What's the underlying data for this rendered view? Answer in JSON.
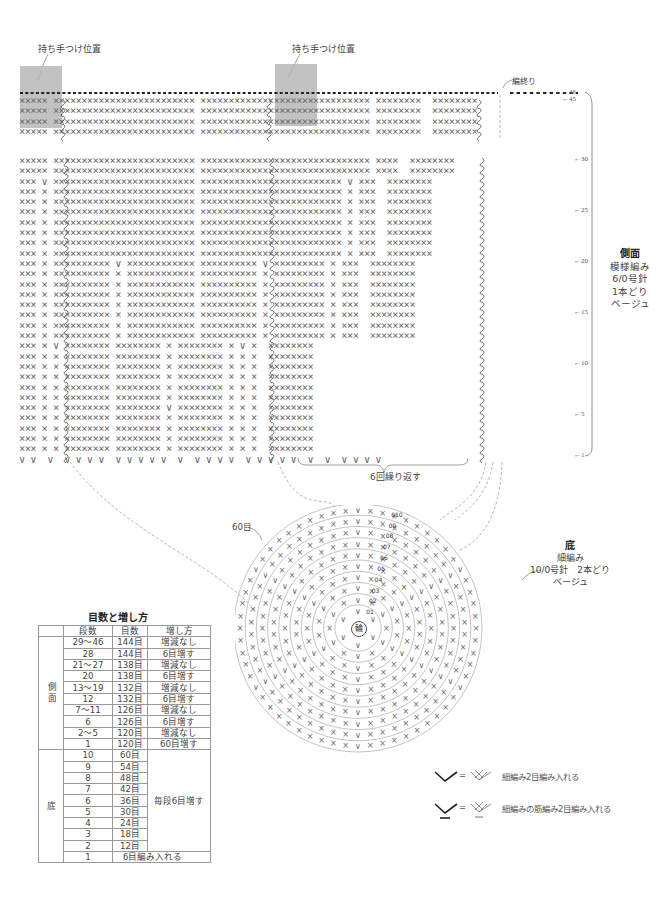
{
  "labels": {
    "handle_position_1": "持ち手つけ位置",
    "handle_position_2": "持ち手つけ位置",
    "finish": "編終り",
    "repeat": "6回繰り返す",
    "bottom_60": "60目",
    "center_ring": "輪"
  },
  "side_info": {
    "title": "側面",
    "pattern": "模様編み",
    "hook": "6/0号針",
    "strands": "1本どり",
    "color": "ベージュ"
  },
  "bottom_info": {
    "title": "底",
    "pattern": "細編み",
    "hook": "10/0号針　2本どり",
    "color": "ベージュ"
  },
  "row_markers": [
    "←46",
    "←45",
    "←30",
    "←25",
    "←20",
    "←15",
    "←10",
    "←5",
    "←1"
  ],
  "round_markers": [
    "1",
    "2",
    "3",
    "4",
    "5",
    "6",
    "7",
    "8",
    "9",
    "10"
  ],
  "table": {
    "title": "目数と増し方",
    "headers": [
      "段数",
      "目数",
      "増し方"
    ],
    "side_group": "側面",
    "bottom_group": "底",
    "side_rows": [
      {
        "rows": "29～46",
        "count": "144目",
        "method": "増減なし"
      },
      {
        "rows": "28",
        "count": "144目",
        "method": "6目増す"
      },
      {
        "rows": "21～27",
        "count": "138目",
        "method": "増減なし"
      },
      {
        "rows": "20",
        "count": "138目",
        "method": "6目増す"
      },
      {
        "rows": "13～19",
        "count": "132目",
        "method": "増減なし"
      },
      {
        "rows": "12",
        "count": "132目",
        "method": "6目増す"
      },
      {
        "rows": "7～11",
        "count": "126目",
        "method": "増減なし"
      },
      {
        "rows": "6",
        "count": "126目",
        "method": "6目増す"
      },
      {
        "rows": "2～5",
        "count": "120目",
        "method": "増減なし"
      },
      {
        "rows": "1",
        "count": "120目",
        "method": "60目増す"
      }
    ],
    "bottom_rows": [
      {
        "rows": "10",
        "count": "60目"
      },
      {
        "rows": "9",
        "count": "54目"
      },
      {
        "rows": "8",
        "count": "48目"
      },
      {
        "rows": "7",
        "count": "42目"
      },
      {
        "rows": "6",
        "count": "36目"
      },
      {
        "rows": "5",
        "count": "30目"
      },
      {
        "rows": "4",
        "count": "24目"
      },
      {
        "rows": "3",
        "count": "18目"
      },
      {
        "rows": "2",
        "count": "12目"
      }
    ],
    "bottom_method": "毎段6目増す",
    "bottom_first": {
      "rows": "1",
      "text": "6目編み入れる"
    }
  },
  "legend": [
    {
      "symbol": "v-increase-icon",
      "eq": "=",
      "text": "細編み2目編み入れる"
    },
    {
      "symbol": "v-underline-increase-icon",
      "eq": "=",
      "text": "細編みの筋編み2目編み入れる"
    }
  ],
  "colors": {
    "stitch": "#6a6a6a",
    "handle_fill": "#b7b7b7",
    "line": "#999999"
  }
}
